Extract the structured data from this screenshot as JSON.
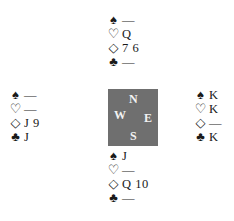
{
  "suits": {
    "spades": "♠",
    "hearts": "♡",
    "diamonds": "◇",
    "clubs": "♣"
  },
  "hands": {
    "north": {
      "spades": "—",
      "hearts": "Q",
      "diamonds": "7 6",
      "clubs": "—"
    },
    "west": {
      "spades": "—",
      "hearts": "—",
      "diamonds": "J 9",
      "clubs": "J"
    },
    "east": {
      "spades": "K",
      "hearts": "K",
      "diamonds": "—",
      "clubs": "K"
    },
    "south": {
      "spades": "J",
      "hearts": "—",
      "diamonds": "Q 10",
      "clubs": "—"
    }
  },
  "compass": {
    "north": "N",
    "west": "W",
    "east": "E",
    "south": "S"
  },
  "colors": {
    "compass_bg": "#6f6f6f",
    "compass_text": "#f2f2f2",
    "ink": "#1a1a1a"
  }
}
